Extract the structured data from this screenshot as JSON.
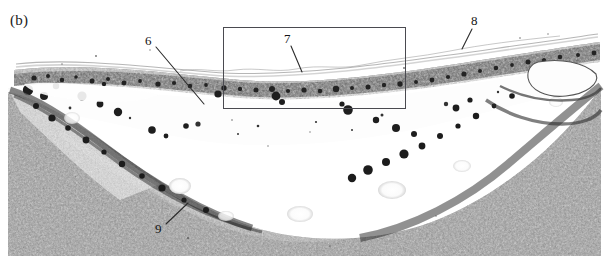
{
  "figure": {
    "panel_label": "(b)",
    "type": "histological-micrograph",
    "width": 609,
    "height": 256,
    "background_color": "#ffffff",
    "ink_color": "#2b2b2b",
    "line_color": "#3a3a3a"
  },
  "inset_box": {
    "name": "region-of-interest",
    "x": 223,
    "y": 27,
    "width": 182,
    "height": 81,
    "stroke": "#4a4a50",
    "stroke_width": 1
  },
  "callouts": [
    {
      "id": "6",
      "label": "6",
      "text_x": 145,
      "text_y": 34,
      "line_x1": 156,
      "line_y1": 47,
      "line_x2": 204,
      "line_y2": 104
    },
    {
      "id": "7",
      "label": "7",
      "text_x": 284,
      "text_y": 32,
      "line_x1": 291,
      "line_y1": 46,
      "line_x2": 302,
      "line_y2": 72
    },
    {
      "id": "8",
      "label": "8",
      "text_x": 471,
      "text_y": 14,
      "line_x1": 472,
      "line_y1": 29,
      "line_x2": 462,
      "line_y2": 49
    },
    {
      "id": "9",
      "label": "9",
      "text_x": 155,
      "text_y": 222,
      "line_x1": 166,
      "line_y1": 224,
      "line_x2": 188,
      "line_y2": 203
    }
  ],
  "tissue_layers": [
    {
      "name": "surface-membrane",
      "description": "Thin pale undulating surface membrane overlying the epithelial band"
    },
    {
      "name": "epithelial-band",
      "description": "Dark continuous band of densely packed epithelial cells sweeping from left edge, dipping at centre and rising to the right edge"
    },
    {
      "name": "clear-space",
      "description": "Pale acellular space separating the epithelial band from the underlying tissue"
    },
    {
      "name": "granular-tissue",
      "description": "Dense stippled granular cell mass forming a broad U-shaped valley across the lower two thirds"
    }
  ]
}
